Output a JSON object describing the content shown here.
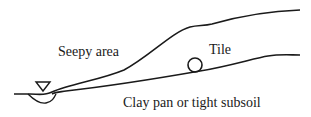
{
  "diagram": {
    "labels": {
      "seepy_area": "Seepy area",
      "tile": "Tile",
      "clay_pan": "Clay pan or tight subsoil"
    },
    "symbols": {
      "water_table": "water-level-triangle",
      "tile_drain": "circle"
    },
    "colors": {
      "line": "#1a1a1a",
      "background": "#ffffff"
    }
  }
}
